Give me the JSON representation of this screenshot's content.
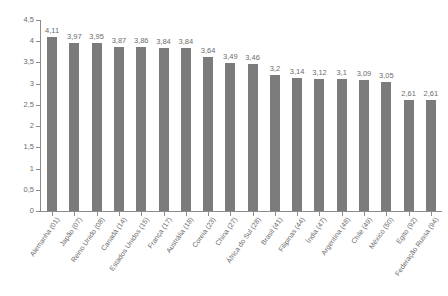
{
  "chart_data": {
    "type": "bar",
    "title": "",
    "subtitle": "",
    "xlabel": "",
    "ylabel": "",
    "ylim": [
      0,
      4.5
    ],
    "grid": false,
    "legend": "none",
    "decimal_separator": ",",
    "bar_color": "#7b7b7b",
    "axis_color": "#8c8c8c",
    "text_color": "#6d6d6d",
    "background_color": "#ffffff",
    "ytick_labels": [
      "0",
      "0,5",
      "1",
      "1,5",
      "2",
      "2,5",
      "3",
      "3,5",
      "4",
      "4,5"
    ],
    "ytick_values": [
      0,
      0.5,
      1,
      1.5,
      2,
      2.5,
      3,
      3.5,
      4,
      4.5
    ],
    "categories": [
      "Alemanha (01)",
      "Japão (07)",
      "Reino Unido (08)",
      "Canadá (14)",
      "Estados Unidos (15)",
      "França (17)",
      "Austrália (18)",
      "Coreia (23)",
      "China (27)",
      "África do Sul (28)",
      "Brasil (41)",
      "Filipinas (44)",
      "Índia (47)",
      "Argentina (48)",
      "Chile (49)",
      "México (50)",
      "Egito (92)",
      "Federação Russa (94)"
    ],
    "values": [
      4.11,
      3.97,
      3.95,
      3.87,
      3.86,
      3.84,
      3.84,
      3.64,
      3.49,
      3.46,
      3.2,
      3.14,
      3.12,
      3.1,
      3.09,
      3.05,
      2.61,
      2.61
    ],
    "value_labels": [
      "4,11",
      "3,97",
      "3,95",
      "3,87",
      "3,86",
      "3,84",
      "3,84",
      "3,64",
      "3,49",
      "3,46",
      "3,2",
      "3,14",
      "3,12",
      "3,1",
      "3,09",
      "3,05",
      "2,61",
      "2,61"
    ]
  }
}
